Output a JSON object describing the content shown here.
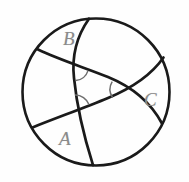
{
  "figure": {
    "kind": "spherical-triangle-diagram",
    "background_color": "#fefefe",
    "stroke_color": "#1a1a1a",
    "angle_mark_color": "#6e6e6e",
    "label_color": "#8a8a8a",
    "sphere": {
      "name": "sphere-outline",
      "center_x": 96,
      "center_y": 92,
      "radius": 74,
      "stroke_width": 2.6
    },
    "vertices": [
      {
        "id": "A",
        "label": "A",
        "x": 78,
        "y": 110,
        "label_x": 59,
        "label_y": 129
      },
      {
        "id": "B",
        "label": "B",
        "x": 82,
        "y": 64,
        "label_x": 63,
        "label_y": 29
      },
      {
        "id": "C",
        "label": "C",
        "x": 133,
        "y": 90,
        "label_x": 144,
        "label_y": 90
      }
    ],
    "arcs": [
      {
        "id": "arc-1",
        "name": "great-circle-arc-vertical",
        "from": "top-of-sphere",
        "to": "bottom-of-sphere"
      },
      {
        "id": "arc-2",
        "name": "great-circle-arc-upper",
        "from": "left-upper-rim",
        "to": "right-upper-rim"
      },
      {
        "id": "arc-3",
        "name": "great-circle-arc-lower",
        "from": "left-lower-rim",
        "to": "right-lower-rim"
      }
    ],
    "angle_marks": [
      {
        "id": "angle-at-B",
        "at_vertex": "B"
      },
      {
        "id": "angle-at-A",
        "at_vertex": "A"
      },
      {
        "id": "angle-at-C",
        "at_vertex": "C"
      }
    ]
  }
}
